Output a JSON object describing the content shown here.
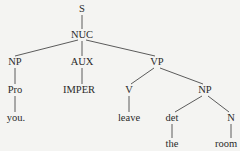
{
  "diagram": {
    "type": "syntax-tree",
    "nodes": [
      {
        "id": "S",
        "label": "S",
        "x": 82,
        "y": 9
      },
      {
        "id": "NUC",
        "label": "NUC",
        "x": 82,
        "y": 35
      },
      {
        "id": "NP1",
        "label": "NP",
        "x": 15,
        "y": 62
      },
      {
        "id": "AUX",
        "label": "AUX",
        "x": 82,
        "y": 62
      },
      {
        "id": "VP",
        "label": "VP",
        "x": 157,
        "y": 62
      },
      {
        "id": "Pro",
        "label": "Pro",
        "x": 15,
        "y": 90
      },
      {
        "id": "IMPER",
        "label": "IMPER",
        "x": 79,
        "y": 90
      },
      {
        "id": "V",
        "label": "V",
        "x": 129,
        "y": 90
      },
      {
        "id": "NP2",
        "label": "NP",
        "x": 205,
        "y": 90
      },
      {
        "id": "you",
        "label": "you.",
        "x": 16,
        "y": 118
      },
      {
        "id": "leave",
        "label": "leave",
        "x": 129,
        "y": 118
      },
      {
        "id": "det",
        "label": "det",
        "x": 172,
        "y": 118
      },
      {
        "id": "N",
        "label": "N",
        "x": 231,
        "y": 118
      },
      {
        "id": "the",
        "label": "the",
        "x": 172,
        "y": 144
      },
      {
        "id": "room",
        "label": "room",
        "x": 226,
        "y": 144
      }
    ],
    "edges": [
      {
        "from": "S",
        "to": "NUC"
      },
      {
        "from": "NUC",
        "to": "NP1"
      },
      {
        "from": "NUC",
        "to": "AUX"
      },
      {
        "from": "NUC",
        "to": "VP"
      },
      {
        "from": "NP1",
        "to": "Pro"
      },
      {
        "from": "AUX",
        "to": "IMPER"
      },
      {
        "from": "VP",
        "to": "V"
      },
      {
        "from": "VP",
        "to": "NP2"
      },
      {
        "from": "Pro",
        "to": "you"
      },
      {
        "from": "V",
        "to": "leave"
      },
      {
        "from": "NP2",
        "to": "det"
      },
      {
        "from": "NP2",
        "to": "N"
      },
      {
        "from": "det",
        "to": "the"
      },
      {
        "from": "N",
        "to": "room"
      }
    ]
  }
}
